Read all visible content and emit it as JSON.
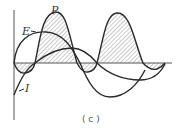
{
  "diagram": {
    "caption": "( c )",
    "labels": {
      "power": "P",
      "voltage": "E",
      "current": "I"
    },
    "colors": {
      "stroke": "#2a2a2a",
      "axis": "#555555",
      "hatch": "#666666",
      "background": "#ffffff"
    }
  }
}
